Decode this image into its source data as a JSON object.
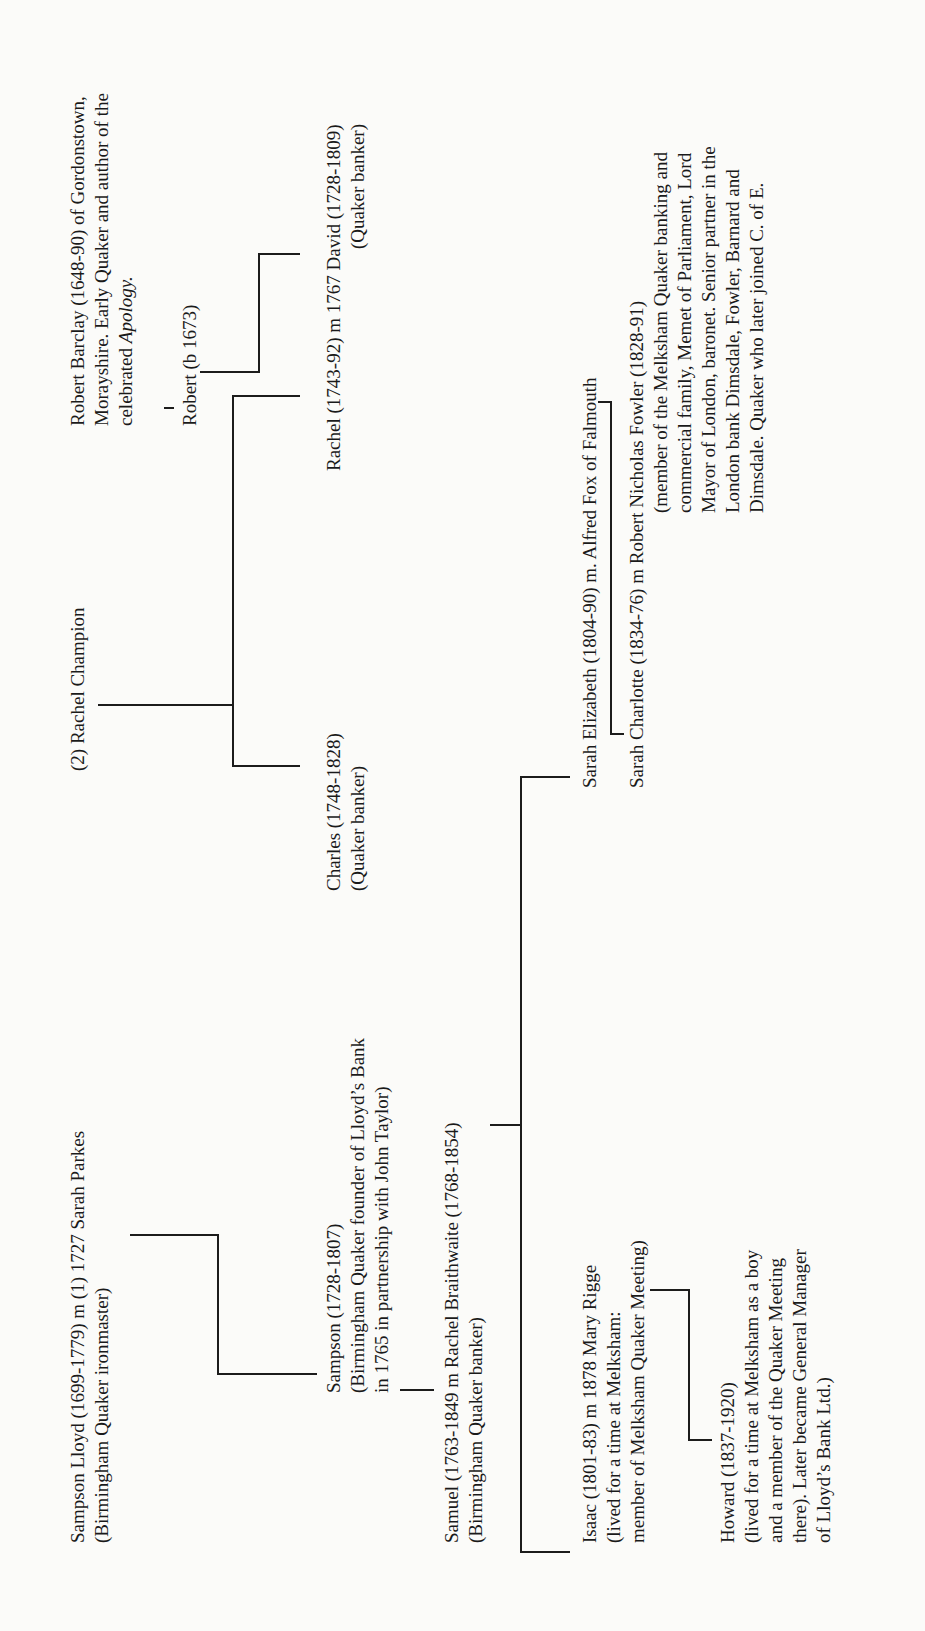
{
  "page": {
    "orientation": "rotated-90-ccw"
  },
  "people": {
    "sampson_lloyd": {
      "line1": "Sampson Lloyd (1699-1779)  m (1) 1727  Sarah Parkes",
      "line2": "(Birmingham Quaker ironmaster)"
    },
    "rachel_champion": {
      "line1": "(2) Rachel Champion"
    },
    "robert_barclay": {
      "line1": "Robert Barclay (1648-90) of Gordonstown,",
      "line2": "Morayshire. Early Quaker and author of the",
      "line3_prefix": "celebrated ",
      "line3_italic": "Apology."
    },
    "robert_b1673": {
      "line1": "Robert (b 1673)"
    },
    "sampson_1728": {
      "line1": "Sampson (1728-1807)",
      "line2": "(Birmingham Quaker founder of Lloyd’s Bank",
      "line3": "in 1765 in partnership with John Taylor)"
    },
    "charles": {
      "line1": "Charles (1748-1828)",
      "line2": "(Quaker banker)"
    },
    "rachel_david": {
      "line1": "Rachel (1743-92) m 1767 David (1728-1809)",
      "line2": "(Quaker banker)"
    },
    "samuel": {
      "line1": "Samuel (1763-1849 m Rachel Braithwaite (1768-1854)",
      "line2": "(Birmingham Quaker banker)"
    },
    "isaac": {
      "line1": "Isaac (1801-83)  m 1878  Mary Rigge",
      "line2": "(lived for a time at Melksham:",
      "line3": "member of Melksham Quaker Meeting)"
    },
    "sarah_elizabeth": {
      "line1": "Sarah Elizabeth (1804-90) m. Alfred Fox of Falmouth"
    },
    "sarah_charlotte": {
      "line1": "Sarah Charlotte (1834-76) m Robert Nicholas Fowler (1828-91)",
      "line2": "(member of the Melksham Quaker banking and",
      "line3": "commercial family, Memet of Parliament, Lord",
      "line4": "Mayor of London, baronet. Senior partner in the",
      "line5": "London bank Dimsdale, Fowler, Barnard and",
      "line6": "Dimsdale. Quaker who later joined C. of E."
    },
    "howard": {
      "line1": "Howard (1837-1920)",
      "line2": "(lived for a time at Melksham as a boy",
      "line3": "and a member of the Quaker Meeting",
      "line4": "there). Later became General Manager",
      "line5": "of Lloyd’s Bank Ltd.)"
    }
  }
}
